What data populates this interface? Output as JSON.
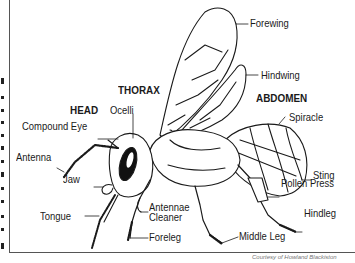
{
  "diagram": {
    "sections": {
      "head": "HEAD",
      "thorax": "THORAX",
      "abdomen": "ABDOMEN"
    },
    "labels": {
      "forewing": "Forewing",
      "hindwing": "Hindwing",
      "ocelli": "Ocelli",
      "compound_eye": "Compound Eye",
      "antenna": "Antenna",
      "jaw": "Jaw",
      "tongue": "Tongue",
      "antennae_cleaner_1": "Antennae",
      "antennae_cleaner_2": "Cleaner",
      "foreleg": "Foreleg",
      "middle_leg": "Middle Leg",
      "spiracle": "Spiracle",
      "sting": "Sting",
      "pollen_press": "Pollen Press",
      "hindleg": "Hindleg"
    },
    "credit": "Courtesy of Howland Blackiston",
    "colors": {
      "ink": "#1a1a1a",
      "frame": "#555555",
      "background": "#ffffff"
    }
  }
}
